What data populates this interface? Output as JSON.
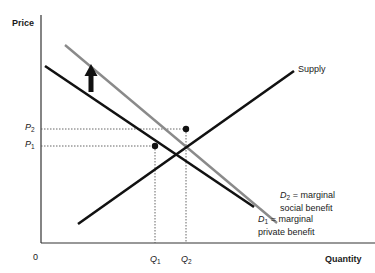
{
  "diagram": {
    "type": "supply-demand positive externality",
    "axes": {
      "y_label": "Price",
      "x_label": "Quantity",
      "origin_label": "0"
    },
    "price_ticks": [
      {
        "sym": "P",
        "sub": "2"
      },
      {
        "sym": "P",
        "sub": "1"
      }
    ],
    "quantity_ticks": [
      {
        "sym": "Q",
        "sub": "1"
      },
      {
        "sym": "Q",
        "sub": "2"
      }
    ],
    "curves": {
      "supply": {
        "label": "Supply",
        "color": "#111111"
      },
      "d1": {
        "sym": "D",
        "sub": "1",
        "line1": " = marginal",
        "line2": "private benefit",
        "color": "#111111"
      },
      "d2": {
        "sym": "D",
        "sub": "2",
        "line1": " = marginal",
        "line2": "social benefit",
        "color": "#8a8a8a"
      }
    },
    "shift_arrow": {
      "direction": "up",
      "meaning": "demand shifts from D1 to D2"
    },
    "equilibria": [
      {
        "name": "private",
        "price": "P1",
        "quantity": "Q1"
      },
      {
        "name": "social",
        "price": "P2",
        "quantity": "Q2"
      }
    ]
  }
}
